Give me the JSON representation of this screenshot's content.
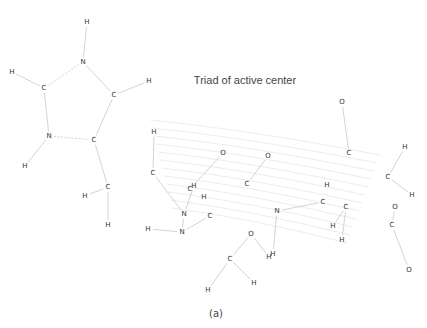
{
  "title": "Triad of active center",
  "caption": "(a)",
  "colors": {
    "atom_label": "#333333",
    "bond": "#c8c8c8",
    "background_arcs": "#ececec",
    "title": "#444444"
  },
  "atoms": [
    {
      "id": "a1",
      "el": "H"
    },
    {
      "id": "a2",
      "el": "N"
    },
    {
      "id": "a3",
      "el": "H"
    },
    {
      "id": "a4",
      "el": "C"
    },
    {
      "id": "a5",
      "el": "C"
    },
    {
      "id": "a6",
      "el": "H"
    },
    {
      "id": "a7",
      "el": "N"
    },
    {
      "id": "a8",
      "el": "C"
    },
    {
      "id": "a9",
      "el": "H"
    },
    {
      "id": "a10",
      "el": "C"
    },
    {
      "id": "a11",
      "el": "H"
    },
    {
      "id": "a12",
      "el": "H"
    },
    {
      "id": "b1",
      "el": "H"
    },
    {
      "id": "b2",
      "el": "C"
    },
    {
      "id": "b3",
      "el": "O"
    },
    {
      "id": "b4",
      "el": "O"
    },
    {
      "id": "b5",
      "el": "C"
    },
    {
      "id": "b6",
      "el": "C"
    },
    {
      "id": "b7",
      "el": "H"
    },
    {
      "id": "b8",
      "el": "H"
    },
    {
      "id": "b9",
      "el": "N"
    },
    {
      "id": "b10",
      "el": "C"
    },
    {
      "id": "b11",
      "el": "N"
    },
    {
      "id": "b12",
      "el": "H"
    },
    {
      "id": "c1",
      "el": "N"
    },
    {
      "id": "c2",
      "el": "O"
    },
    {
      "id": "c3",
      "el": "H"
    },
    {
      "id": "c4",
      "el": "H"
    },
    {
      "id": "c5",
      "el": "C"
    },
    {
      "id": "c6",
      "el": "H"
    },
    {
      "id": "c7",
      "el": "H"
    },
    {
      "id": "d1",
      "el": "H"
    },
    {
      "id": "d2",
      "el": "C"
    },
    {
      "id": "d3",
      "el": "C"
    },
    {
      "id": "d4",
      "el": "H"
    },
    {
      "id": "d5",
      "el": "H"
    },
    {
      "id": "e1",
      "el": "O"
    },
    {
      "id": "e2",
      "el": "C"
    },
    {
      "id": "f1",
      "el": "H"
    },
    {
      "id": "f2",
      "el": "C"
    },
    {
      "id": "f3",
      "el": "H"
    },
    {
      "id": "f4",
      "el": "O"
    },
    {
      "id": "f5",
      "el": "C"
    },
    {
      "id": "f6",
      "el": "O"
    }
  ],
  "bonds": [
    [
      "a1",
      "a2"
    ],
    [
      "a2",
      "a4",
      1
    ],
    [
      "a2",
      "a5"
    ],
    [
      "a4",
      "a3"
    ],
    [
      "a4",
      "a7"
    ],
    [
      "a7",
      "a8",
      1
    ],
    [
      "a7",
      "a9"
    ],
    [
      "a5",
      "a6"
    ],
    [
      "a5",
      "a8"
    ],
    [
      "a8",
      "a10"
    ],
    [
      "a10",
      "a11"
    ],
    [
      "a10",
      "a12"
    ],
    [
      "b1",
      "b2"
    ],
    [
      "b2",
      "b9"
    ],
    [
      "b3",
      "b6"
    ],
    [
      "b4",
      "b5"
    ],
    [
      "b7",
      "b9"
    ],
    [
      "b9",
      "b11"
    ],
    [
      "b11",
      "b12"
    ],
    [
      "b11",
      "b10"
    ],
    [
      "c1",
      "c3"
    ],
    [
      "c1",
      "c1x"
    ],
    [
      "c2",
      "c5"
    ],
    [
      "c2",
      "c4"
    ],
    [
      "c5",
      "c6"
    ],
    [
      "c5",
      "c7"
    ],
    [
      "c1",
      "d2"
    ],
    [
      "d3",
      "d5"
    ],
    [
      "d4",
      "d3"
    ],
    [
      "e1",
      "e2"
    ],
    [
      "f1",
      "f2"
    ],
    [
      "f2",
      "f3"
    ],
    [
      "f4",
      "f5"
    ],
    [
      "f5",
      "f6"
    ]
  ]
}
